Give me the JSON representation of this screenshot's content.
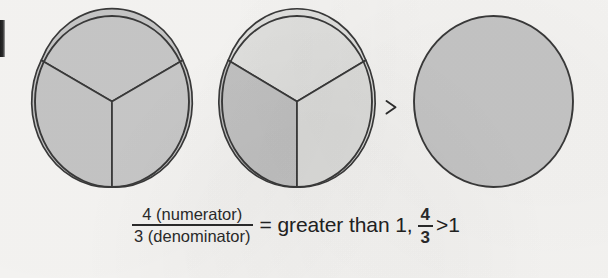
{
  "figure": {
    "background_color": "#f8f7f5",
    "stroke_color": "#3a3a3a",
    "comparison_symbol": ">",
    "circles": [
      {
        "name": "circle-one-whole",
        "label": "three thirds shaded",
        "cx": 112,
        "cy": 101.5,
        "rx": 77,
        "ry": 85.5,
        "divided": true,
        "slices": [
          {
            "name": "slice-top",
            "shaded": true,
            "fill": "#c9c9c9"
          },
          {
            "name": "slice-bottom-left",
            "shaded": true,
            "fill": "#c7c7c7"
          },
          {
            "name": "slice-bottom-right",
            "shaded": true,
            "fill": "#cacaca"
          }
        ]
      },
      {
        "name": "circle-one-third",
        "label": "one third shaded",
        "cx": 297,
        "cy": 101.5,
        "rx": 75,
        "ry": 85.5,
        "divided": true,
        "slices": [
          {
            "name": "slice-top",
            "shaded": false,
            "fill": "#e3e3e1"
          },
          {
            "name": "slice-bottom-left",
            "shaded": true,
            "fill": "#c4c4c4"
          },
          {
            "name": "slice-bottom-right",
            "shaded": false,
            "fill": "#e0e0de"
          }
        ]
      },
      {
        "name": "circle-reference-whole",
        "label": "one whole",
        "cx": 493.5,
        "cy": 101.5,
        "rx": 79.5,
        "ry": 85.5,
        "divided": false,
        "slices": [
          {
            "name": "slice-whole",
            "shaded": true,
            "fill": "#c8c8c8"
          }
        ]
      }
    ]
  },
  "formula": {
    "numerator_label": "4 (numerator)",
    "denominator_label": "3 (denominator)",
    "equals_phrase": "= greater than 1,",
    "inline_numerator": "4",
    "inline_denominator": "3",
    "inline_comparison": ">1"
  }
}
